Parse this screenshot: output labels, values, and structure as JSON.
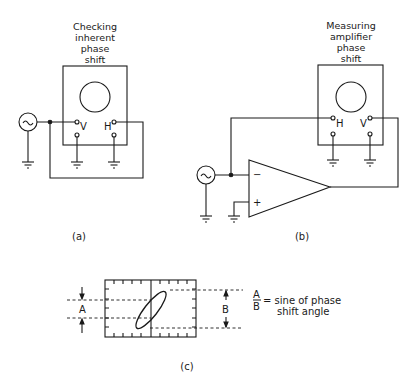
{
  "figure_a": {
    "title_lines": [
      "Checking",
      "inherent",
      "phase",
      "shift"
    ],
    "terminal_v": "V",
    "terminal_h": "H",
    "caption": "(a)"
  },
  "figure_b": {
    "title_lines": [
      "Measuring",
      "amplifier",
      "phase",
      "shift"
    ],
    "terminal_h": "H",
    "terminal_v": "V",
    "opamp_inverting": "−",
    "opamp_noninverting": "+",
    "caption": "(b)"
  },
  "figure_c": {
    "label_a": "A",
    "label_b": "B",
    "fraction_num": "A",
    "fraction_den": "B",
    "equation_text_line1": "= sine of phase",
    "equation_text_line2": "shift angle",
    "caption": "(c)"
  },
  "icons": {
    "ac_source": "~"
  },
  "colors": {
    "ink": "#1a1a1a",
    "background": "#ffffff"
  }
}
